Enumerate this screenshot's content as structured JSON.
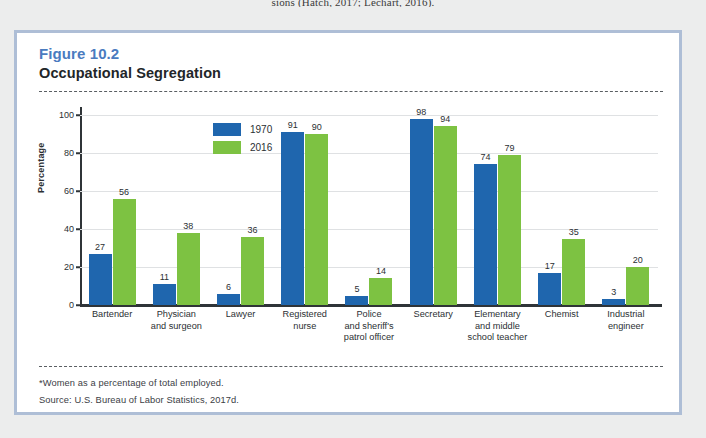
{
  "page": {
    "top_text_fragment": "sions (Hatch, 2017; Lechart, 2016)."
  },
  "figure": {
    "number": "Figure 10.2",
    "title": "Occupational Segregation",
    "footnote": "*Women as a percentage of total employed.",
    "source": "Source: U.S. Bureau of Labor Statistics, 2017d.",
    "colors": {
      "series_1970": "#1f66ae",
      "series_2016": "#7dc242",
      "figure_number": "#4a7bbf",
      "border": "#aebed6"
    }
  },
  "chart_data": {
    "type": "bar",
    "title": "Occupational Segregation",
    "xlabel": "",
    "ylabel": "Percentage",
    "ylim": [
      0,
      100
    ],
    "yticks": [
      0,
      20,
      40,
      60,
      80,
      100
    ],
    "grid": true,
    "legend_position": "top-left-inside",
    "categories": [
      "Bartender",
      "Physician and surgeon",
      "Lawyer",
      "Registered nurse",
      "Police and sheriff's patrol officer",
      "Secretary",
      "Elementary and middle school teacher",
      "Chemist",
      "Industrial engineer"
    ],
    "category_lines": [
      [
        "Bartender"
      ],
      [
        "Physician",
        "and surgeon"
      ],
      [
        "Lawyer"
      ],
      [
        "Registered",
        "nurse"
      ],
      [
        "Police",
        "and sheriff's",
        "patrol officer"
      ],
      [
        "Secretary"
      ],
      [
        "Elementary",
        "and middle",
        "school teacher"
      ],
      [
        "Chemist"
      ],
      [
        "Industrial",
        "engineer"
      ]
    ],
    "series": [
      {
        "name": "1970",
        "color": "#1f66ae",
        "values": [
          27,
          11,
          6,
          91,
          5,
          98,
          74,
          17,
          3
        ]
      },
      {
        "name": "2016",
        "color": "#7dc242",
        "values": [
          56,
          38,
          36,
          90,
          14,
          94,
          79,
          35,
          20
        ]
      }
    ]
  }
}
